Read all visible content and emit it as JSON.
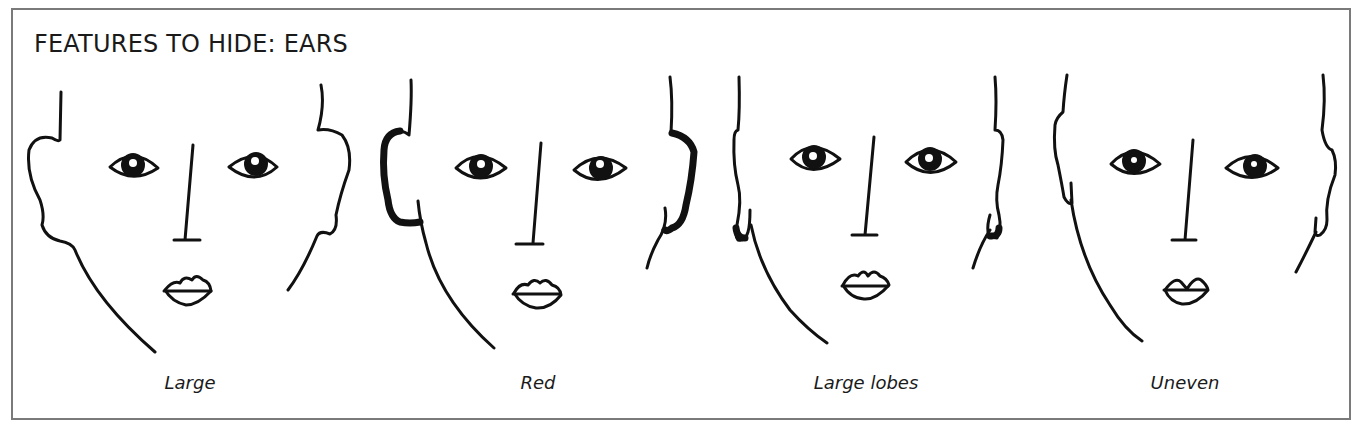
{
  "figure": {
    "title": "FEATURES TO HIDE: EARS",
    "panels": [
      {
        "id": "large",
        "caption": "Large",
        "center_x": 190
      },
      {
        "id": "red",
        "caption": "Red",
        "center_x": 538
      },
      {
        "id": "large-lobes",
        "caption": "Large lobes",
        "center_x": 866
      },
      {
        "id": "uneven",
        "caption": "Uneven",
        "center_x": 1185
      }
    ],
    "colors": {
      "ink": "#111111",
      "border": "#7a7a7a",
      "background": "#ffffff"
    }
  }
}
